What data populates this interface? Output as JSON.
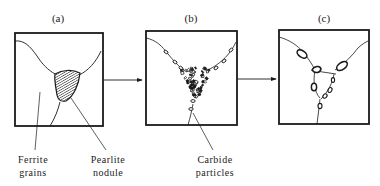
{
  "figure": {
    "panels": [
      {
        "id": "a",
        "label": "(a)",
        "description": "Ferrite grains with pearlite nodule at triple junction"
      },
      {
        "id": "b",
        "label": "(b)",
        "description": "Pearlite spheroidizing into carbide particles along grain boundaries"
      },
      {
        "id": "c",
        "label": "(c)",
        "description": "Coarsened carbide particles at grain boundaries"
      }
    ],
    "annotations": {
      "ferrite": [
        "Ferrite",
        "grains"
      ],
      "pearlite": [
        "Pearlite",
        "nodule"
      ],
      "carbide": [
        "Carbide",
        "particles"
      ]
    },
    "colors": {
      "ink": "#1a1a1a",
      "background": "#ffffff"
    }
  }
}
